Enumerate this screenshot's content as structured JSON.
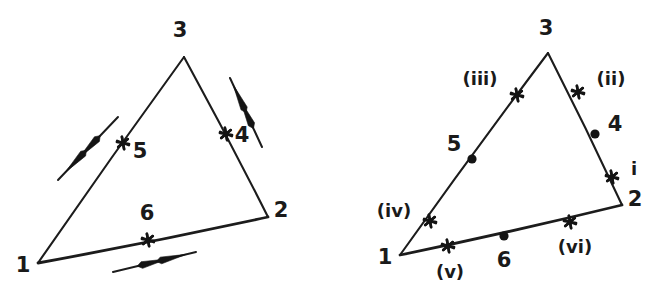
{
  "figure": {
    "width": 664,
    "height": 301,
    "background": "#ffffff",
    "ink_color": "#1c1c1c",
    "panels": [
      {
        "name": "left-panel",
        "triangle": {
          "vertices": [
            {
              "id": "v1",
              "label": "1",
              "x": 38,
              "y": 263,
              "label_x": 23,
              "label_y": 266
            },
            {
              "id": "v2",
              "label": "2",
              "x": 268,
              "y": 217,
              "label_x": 281,
              "label_y": 211
            },
            {
              "id": "v3",
              "label": "3",
              "x": 184,
              "y": 57,
              "label_x": 180,
              "label_y": 31
            }
          ],
          "edges": [
            {
              "name": "edge-1-3",
              "from": "v1",
              "to": "v3",
              "weight": "thin"
            },
            {
              "name": "edge-3-2",
              "from": "v3",
              "to": "v2",
              "weight": "thin"
            },
            {
              "name": "edge-1-2",
              "from": "v1",
              "to": "v2",
              "weight": "thick"
            }
          ]
        },
        "midpoint_markers": [
          {
            "name": "marker-5",
            "label": "5",
            "shape": "star",
            "x": 123,
            "y": 143,
            "label_x": 140,
            "label_y": 152
          },
          {
            "name": "marker-4",
            "label": "4",
            "shape": "star",
            "x": 226,
            "y": 134,
            "label_x": 242,
            "label_y": 136
          },
          {
            "name": "marker-6",
            "label": "6",
            "shape": "star",
            "x": 148,
            "y": 240,
            "label_x": 147,
            "label_y": 214
          }
        ],
        "vectors": [
          {
            "name": "double-arrow-edge-1-3",
            "note": "double arrowhead pointing down-left, parallel to edge 1-3",
            "x1": 118,
            "y1": 117,
            "x2": 58,
            "y2": 180,
            "heads": 2,
            "direction": "down-left"
          },
          {
            "name": "double-arrow-edge-3-2",
            "note": "double arrowhead pointing up-right, parallel to edge 3-2",
            "x1": 262,
            "y1": 147,
            "x2": 230,
            "y2": 78,
            "heads": 2,
            "direction": "up-right"
          },
          {
            "name": "double-arrow-edge-1-2",
            "note": "double arrowhead pointing right, parallel to edge 1-2",
            "x1": 113,
            "y1": 272,
            "x2": 196,
            "y2": 252,
            "heads": 2,
            "direction": "right"
          }
        ]
      },
      {
        "name": "right-panel",
        "triangle": {
          "vertices": [
            {
              "id": "v1",
              "label": "1",
              "x": 68,
              "y": 255,
              "label_x": 53,
              "label_y": 258
            },
            {
              "id": "v2",
              "label": "2",
              "x": 290,
              "y": 205,
              "label_x": 303,
              "label_y": 200
            },
            {
              "id": "v3",
              "label": "3",
              "x": 216,
              "y": 53,
              "label_x": 214,
              "label_y": 29
            }
          ],
          "edges": [
            {
              "name": "edge-1-3",
              "from": "v1",
              "to": "v3",
              "weight": "thin"
            },
            {
              "name": "edge-3-2",
              "from": "v3",
              "to": "v2",
              "weight": "thin"
            },
            {
              "name": "edge-1-2",
              "from": "v1",
              "to": "v2",
              "weight": "thick"
            }
          ]
        },
        "markers": [
          {
            "name": "marker-iii",
            "label": "(iii)",
            "shape": "star",
            "x": 185,
            "y": 95,
            "label_x": 148,
            "label_y": 80,
            "style": "roman"
          },
          {
            "name": "marker-ii",
            "label": "(ii)",
            "shape": "star",
            "x": 246,
            "y": 92,
            "label_x": 279,
            "label_y": 80,
            "style": "roman"
          },
          {
            "name": "marker-4",
            "label": "4",
            "shape": "dot",
            "x": 263,
            "y": 134,
            "label_x": 283,
            "label_y": 125,
            "style": "number"
          },
          {
            "name": "marker-i",
            "label": "i",
            "shape": "star",
            "x": 280,
            "y": 177,
            "label_x": 302,
            "label_y": 170,
            "style": "roman"
          },
          {
            "name": "marker-5",
            "label": "5",
            "shape": "dot",
            "x": 140,
            "y": 159,
            "label_x": 122,
            "label_y": 145,
            "style": "number"
          },
          {
            "name": "marker-iv",
            "label": "(iv)",
            "shape": "star",
            "x": 98,
            "y": 221,
            "label_x": 62,
            "label_y": 212,
            "style": "roman"
          },
          {
            "name": "marker-v",
            "label": "(v)",
            "shape": "star",
            "x": 116,
            "y": 246,
            "label_x": 118,
            "label_y": 273,
            "style": "roman"
          },
          {
            "name": "marker-6",
            "label": "6",
            "shape": "dot",
            "x": 172,
            "y": 236,
            "label_x": 172,
            "label_y": 261,
            "style": "number"
          },
          {
            "name": "marker-vi",
            "label": "(vi)",
            "shape": "star",
            "x": 238,
            "y": 222,
            "label_x": 243,
            "label_y": 248,
            "style": "roman"
          }
        ]
      }
    ]
  }
}
